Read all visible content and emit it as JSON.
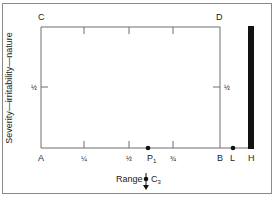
{
  "diagram": {
    "y_axis_label": "Severity—irritability—nature",
    "corners": {
      "top_left": "C",
      "top_right": "D",
      "bottom_left": "A",
      "bottom_right_inner": "B"
    },
    "x_ticks": [
      "¼",
      "½",
      "¾"
    ],
    "y_half_left": "½",
    "y_half_right": "½",
    "points": {
      "p1": {
        "label": "P",
        "subscript": "1"
      },
      "l": {
        "label": "L"
      },
      "h": {
        "label": "H"
      }
    },
    "range": {
      "label": "Range",
      "point_label": "C",
      "point_subscript": "3"
    },
    "colors": {
      "line": "#6e6e6e",
      "bar": "#111111",
      "frame": "#8a8a8a"
    }
  }
}
